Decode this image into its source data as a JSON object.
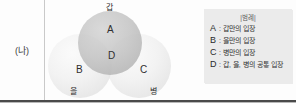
{
  "row": {
    "label": "(나)"
  },
  "venn": {
    "regions": [
      {
        "key": "A",
        "name": "gap-only"
      },
      {
        "key": "B",
        "name": "eul-only"
      },
      {
        "key": "C",
        "name": "byeong-only"
      },
      {
        "key": "D",
        "name": "common"
      }
    ],
    "outer_labels": {
      "top": "갑",
      "bottom_left": "을",
      "bottom_right": "병"
    },
    "colors": {
      "gap_circle": "#bdbdbd",
      "eul_circle": "#efefef",
      "byeong_circle": "#efefef"
    }
  },
  "legend": {
    "title": "|범례|",
    "separator": ":",
    "items": [
      {
        "key": "A",
        "desc": "갑만의 입장"
      },
      {
        "key": "B",
        "desc": "을만의 입장"
      },
      {
        "key": "C",
        "desc": "병만의 입장"
      },
      {
        "key": "D",
        "desc": "갑, 을, 병의 공통 입장"
      }
    ],
    "background": "#ebebeb"
  }
}
